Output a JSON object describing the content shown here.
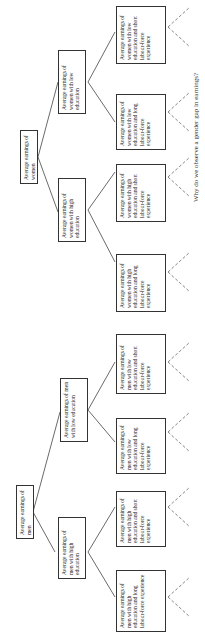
{
  "diagram": {
    "type": "tree",
    "orientation": "rotated-90-ccw",
    "root_men": {
      "label": "Average earnings of men"
    },
    "root_women": {
      "label": "Average earnings of women"
    },
    "level2": [
      {
        "id": "men-high",
        "label": "Average earnings of men with high education"
      },
      {
        "id": "men-low",
        "label": "Average earnings of men with low education"
      },
      {
        "id": "women-high",
        "label": "Average earnings of women with high education"
      },
      {
        "id": "women-low",
        "label": "Average earnings of women with low education"
      }
    ],
    "level3": [
      {
        "id": "men-high-long",
        "label": "Average earnings of men with high education and long labour-force experience"
      },
      {
        "id": "men-high-short",
        "label": "Average earnings of men with high education and short labour-force experience"
      },
      {
        "id": "men-low-long",
        "label": "Average earnings of men with low education and long labour-force experience"
      },
      {
        "id": "men-low-short",
        "label": "Average earnings of men with low education and short labour-force experience"
      },
      {
        "id": "women-high-long",
        "label": "Average earnings of women with high education and long labour-force experience"
      },
      {
        "id": "women-high-short",
        "label": "Average earnings of women with high education and short labour-force experience"
      },
      {
        "id": "women-low-long",
        "label": "Average earnings of women with low education and long labour-force experience"
      },
      {
        "id": "women-low-short",
        "label": "Average earnings of women with low education and short labour-force experience"
      }
    ],
    "caption": "Why do we observe a gender gap in earnings?"
  }
}
